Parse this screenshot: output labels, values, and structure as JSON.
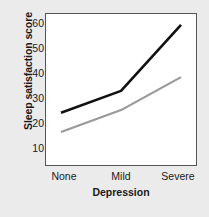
{
  "chart_data": {
    "type": "line",
    "title": "",
    "xlabel": "Depression",
    "ylabel": "Sleep satisfaction score",
    "categories": [
      "None",
      "Mild",
      "Severe"
    ],
    "xticklabels": [
      "None",
      "Mild",
      "Severe"
    ],
    "yticklabels": [
      "60",
      "50",
      "40",
      "30",
      "20",
      "10"
    ],
    "ytickvalues": [
      60,
      50,
      40,
      30,
      20,
      10
    ],
    "ylim": [
      7,
      62
    ],
    "xlim": [
      -0.25,
      2.25
    ],
    "grid": false,
    "legend": false,
    "legend_position": "none",
    "series": [
      {
        "name": "black-line",
        "color": "#111111",
        "linewidth": 2.6,
        "values": [
          26,
          34,
          58
        ]
      },
      {
        "name": "gray-line",
        "color": "#999999",
        "linewidth": 2.2,
        "values": [
          19,
          27,
          39
        ]
      }
    ],
    "annotations": []
  },
  "figure": {
    "background_color": "#ebebeb",
    "plot_background_color": "#ffffff",
    "frame_color": "#555555"
  }
}
